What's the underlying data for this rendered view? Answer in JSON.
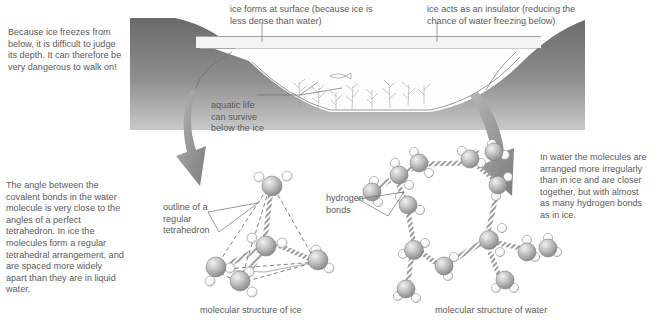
{
  "figure": {
    "labels": {
      "ice_surface": "ice forms at surface (because ice is\nless dense than water)",
      "insulator": "ice acts as an insulator (reducing the\nchance of water freezing below)",
      "walk_warning": "Because ice freezes from\nbelow, it is difficult to judge\nits depth. It can therefore be\nvery dangerous to walk on!",
      "aquatic_life": "aquatic life\ncan survive\nbelow the ice",
      "tetra_angle": "The angle between the\ncovalent bonds in the water\nmolecule is very close to the\nangles of a perfect\ntetrahedron. In ice the\nmolecules form a regular\ntetrahedral arrangement, and\nare spaced more widely\napart than they are in liquid\nwater.",
      "outline_tetra": "outline of a\nregular\ntetrahedron",
      "hydrogen_bonds": "hydrogen\nbonds",
      "water_irregular": "In water the molecules are\narranged more irregularly\nthan in ice and are closer\ntogether, but with almost\nas many hydrogen bonds\nas in ice.",
      "caption_ice": "molecular structure of ice",
      "caption_water": "molecular structure of water"
    },
    "colors": {
      "text": "#5a5a5a",
      "ground_dark": "#6f6f6f",
      "ground_light": "#a8a8a8",
      "ice_layer": "#f2f2f2",
      "water": "#fcfcfc",
      "arrow": "#8a8a8a",
      "oxygen": "#b9b9b9",
      "hydrogen": "#ffffff",
      "bond": "#9a9a9a",
      "outline": "#555555"
    },
    "molecules": {
      "ice_label": "tetrahedral arrangement",
      "ice_count": 5,
      "water_label": "irregular ring arrangement",
      "water_count": 12
    }
  }
}
